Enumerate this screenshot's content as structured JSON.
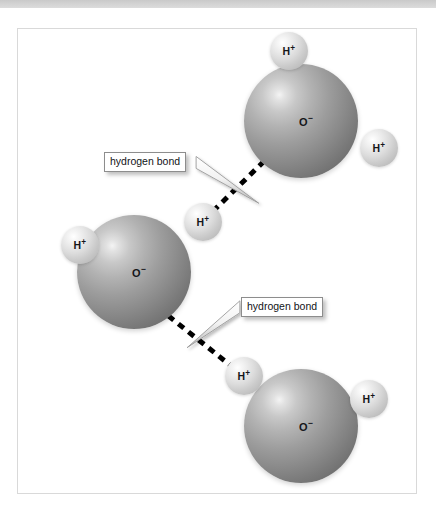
{
  "figure": {
    "frame": {
      "x": 17,
      "y": 28,
      "width": 400,
      "height": 466,
      "background": "#ffffff",
      "border_color": "#d9d9d9"
    },
    "top_bar": {
      "height": 8,
      "color": "#d2d2d2"
    }
  },
  "legend_colors": {
    "oxygen_sphere": "#8b8b8b",
    "hydrogen_sphere": "#dcdcdc",
    "bond_line": "#000000",
    "callout_border": "#8d8d8d",
    "callout_background": "#ffffff",
    "label_text": "#15161a"
  },
  "molecules": [
    {
      "id": "water-top-right",
      "oxygen": {
        "label_text": "O",
        "label_charge": "−",
        "cx": 283,
        "cy": 92,
        "r": 57,
        "label_dx": 5,
        "label_dy": 1
      },
      "hydrogens": [
        {
          "id": "h-top-right-upper",
          "label_text": "H",
          "label_charge": "+",
          "cx": 271,
          "cy": 22,
          "r": 19
        },
        {
          "id": "h-top-right-side",
          "label_text": "H",
          "label_charge": "+",
          "cx": 361,
          "cy": 119,
          "r": 19
        }
      ]
    },
    {
      "id": "water-middle-left",
      "oxygen": {
        "label_text": "O",
        "label_charge": "−",
        "cx": 116,
        "cy": 243,
        "r": 57,
        "label_dx": 5,
        "label_dy": 1
      },
      "hydrogens": [
        {
          "id": "h-middle-left-side",
          "label_text": "H",
          "label_charge": "+",
          "cx": 62,
          "cy": 216,
          "r": 19
        },
        {
          "id": "h-middle-upper-right",
          "label_text": "H",
          "label_charge": "+",
          "cx": 185,
          "cy": 193,
          "r": 19
        }
      ]
    },
    {
      "id": "water-bottom-right",
      "oxygen": {
        "label_text": "O",
        "label_charge": "−",
        "cx": 283,
        "cy": 397,
        "r": 57,
        "label_dx": 5,
        "label_dy": 1
      },
      "hydrogens": [
        {
          "id": "h-bottom-left-upper",
          "label_text": "H",
          "label_charge": "+",
          "cx": 226,
          "cy": 347,
          "r": 19
        },
        {
          "id": "h-bottom-right-side",
          "label_text": "H",
          "label_charge": "+",
          "cx": 351,
          "cy": 370,
          "r": 19
        }
      ]
    }
  ],
  "bonds": [
    {
      "id": "hydrogen-bond-upper",
      "type": "hydrogen-bond",
      "x1": 196,
      "y1": 183,
      "x2": 246,
      "y2": 134,
      "dash": "7 6",
      "width": 5
    },
    {
      "id": "hydrogen-bond-lower",
      "type": "hydrogen-bond",
      "x1": 151,
      "y1": 288,
      "x2": 215,
      "y2": 339,
      "dash": "7 6",
      "width": 5
    }
  ],
  "callouts": [
    {
      "id": "callout-upper",
      "text": "hydrogen bond",
      "box": {
        "x": 86,
        "y": 123,
        "width": 93,
        "height": 17
      },
      "pointer": {
        "tip_x": 242,
        "tip_y": 175,
        "base_top_x": 179,
        "base_top_y": 128,
        "base_bottom_x": 179,
        "base_bottom_y": 140
      }
    },
    {
      "id": "callout-lower",
      "text": "hydrogen bond",
      "box": {
        "x": 223,
        "y": 268,
        "width": 93,
        "height": 17
      },
      "pointer": {
        "tip_x": 170,
        "tip_y": 320,
        "base_top_x": 223,
        "base_top_y": 273,
        "base_bottom_x": 223,
        "base_bottom_y": 285
      }
    }
  ]
}
